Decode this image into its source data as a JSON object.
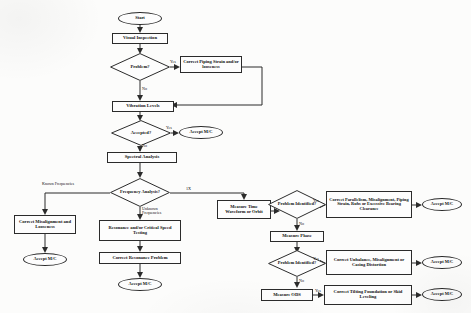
{
  "diagram": {
    "type": "flowchart",
    "nodes": {
      "start": "Start",
      "visual_inspection": "Visual Inspection",
      "problem_q1": "Problem?",
      "correct_piping": "Correct Piping Strain and/or looseness",
      "vibration_levels": "Vibration Levels",
      "accepted_q": "Accepted?",
      "accept_mc_1": "Accept M/C",
      "spectral_analysis": "Spectral Analysis",
      "frequency_analysis_q": "Frequency Analysis?",
      "correct_misalignment": "Correct Misalignment and Looseness",
      "accept_mc_2": "Accept M/C",
      "resonance_testing": "Resonance and/or Critical Speed Testing",
      "correct_resonance": "Correct Resonance Problem",
      "accept_mc_3": "Accept M/C",
      "measure_time_waveform": "Measure Time Waveform or Orbit",
      "problem_identified_q1": "Problem Identified?",
      "correct_parallelism": "Correct Parallelism, Misalignment, Piping Strain, Rubs or Excessive Bearing Clearance",
      "accept_mc_4": "Accept M/C",
      "measure_phase": "Measure Phase",
      "problem_identified_q2": "Problem Identified?",
      "correct_unbalance": "Correct Unbalance, Misalignment or Casing Distortion",
      "accept_mc_5": "Accept M/C",
      "measure_ods": "Measure ODS",
      "correct_tilting": "Correct Tilting Foundation or Skid Leveling",
      "accept_mc_6": "Accept M/C"
    },
    "edge_labels": {
      "yes_1": "Yes",
      "no_1": "No",
      "yes_2": "Yes",
      "no_2": "No",
      "known_frequencies": "Known Frequencies",
      "unknown_frequencies": "Unknown Frequencies",
      "one_x": "1X",
      "yes_3": "Yes",
      "no_3": "No",
      "yes_4": "Yes",
      "no_4": "No",
      "yes_5": "Yes"
    },
    "colors": {
      "ink": "#2b2b2b",
      "paper": "#fcfcfb"
    }
  }
}
